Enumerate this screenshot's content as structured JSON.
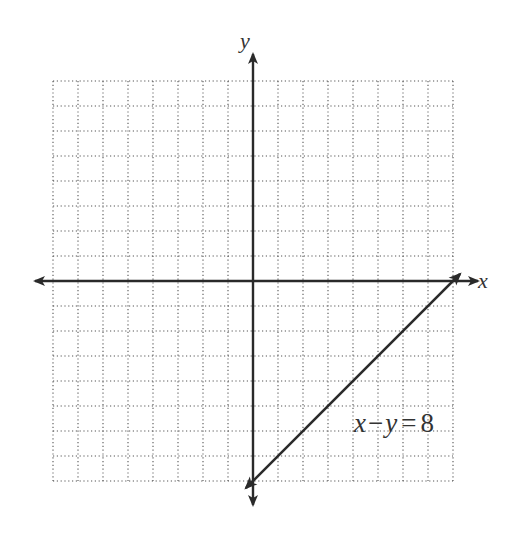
{
  "chart_data": {
    "type": "line",
    "title": "",
    "xlabel": "x",
    "ylabel": "y",
    "xlim": [
      -8,
      8
    ],
    "ylim": [
      -8,
      8
    ],
    "grid": true,
    "grid_step": 1,
    "series": [
      {
        "name": "x − y = 8",
        "equation": "x - y = 8",
        "points": [
          [
            0,
            -8
          ],
          [
            8,
            0
          ]
        ]
      }
    ],
    "annotations": [
      {
        "text": "x − y = 8",
        "x": 5.3,
        "y": -6
      }
    ]
  },
  "labels": {
    "x_axis": "x",
    "y_axis": "y",
    "equation_x": "x",
    "equation_minus": "−",
    "equation_y": "y",
    "equation_eq": "=",
    "equation_const": "8"
  },
  "style": {
    "line_color": "#2a2a2a",
    "grid_color": "#555555",
    "background": "#ffffff"
  }
}
